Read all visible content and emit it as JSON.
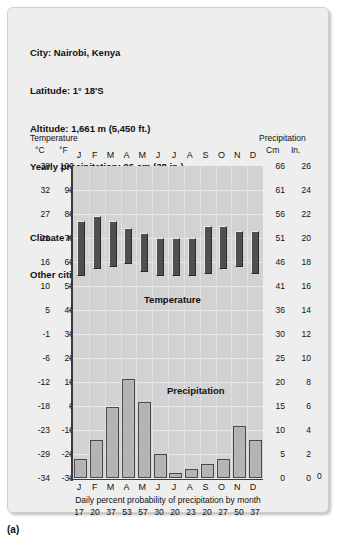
{
  "figure": {
    "label": "(a)"
  },
  "header": {
    "lines": [
      "City: Nairobi, Kenya",
      "Latitude: 1° 18'S",
      "Altitude: 1,661 m (5,450 ft.)",
      "Yearly precipitation: 96 cm (38 in.)"
    ],
    "lines2": [
      "Climate name: Savanna",
      "Other cities with similar climates: Dakar, Kampala"
    ]
  },
  "axes": {
    "left_title": "Temperature",
    "right_title": "Precipitation",
    "left_unit_primary": "°C",
    "left_unit_secondary": "°F",
    "right_unit_primary": "Cm",
    "right_unit_secondary": "In.",
    "celsius_ticks": [
      "38",
      "32",
      "27",
      "21",
      "16",
      "10",
      "5",
      "-1",
      "-6",
      "-12",
      "-18",
      "-23",
      "-29",
      "-34"
    ],
    "fahrenheit_ticks": [
      "100",
      "90",
      "80",
      "70",
      "60",
      "50",
      "40",
      "30",
      "20",
      "10",
      "0",
      "-10",
      "-20",
      "-30"
    ],
    "cm_ticks": [
      "66",
      "61",
      "56",
      "51",
      "46",
      "41",
      "36",
      "30",
      "25",
      "20",
      "15",
      "10",
      "5",
      "0"
    ],
    "in_ticks": [
      "26",
      "24",
      "22",
      "20",
      "18",
      "16",
      "14",
      "12",
      "10",
      "8",
      "6",
      "4",
      "2",
      "0"
    ],
    "right_zero": "0"
  },
  "labels": {
    "temperature": "Temperature",
    "precipitation": "Precipitation",
    "footer_caption": "Daily percent probability of precipitation by month"
  },
  "chart_data": {
    "type": "bar",
    "categories": [
      "J",
      "F",
      "M",
      "A",
      "M",
      "J",
      "J",
      "A",
      "S",
      "O",
      "N",
      "D"
    ],
    "xlabel": "",
    "grid": true,
    "legend": "inline-annotations",
    "series": [
      {
        "name": "Temperature",
        "type": "range-bar",
        "unit": "°F",
        "ylabel": "Temperature",
        "ylim_f": [
          -30,
          100
        ],
        "ylim_c": [
          -34,
          38
        ],
        "high_f": [
          77,
          79,
          77,
          74,
          72,
          70,
          70,
          70,
          75,
          75,
          73,
          73
        ],
        "low_f": [
          54,
          57,
          58,
          59,
          56,
          54,
          54,
          54,
          55,
          57,
          58,
          55
        ],
        "high_c": [
          25,
          26,
          25,
          23,
          22,
          21,
          21,
          21,
          24,
          24,
          23,
          23
        ],
        "low_c": [
          12,
          14,
          14,
          15,
          13,
          12,
          12,
          12,
          13,
          14,
          14,
          13
        ]
      },
      {
        "name": "Precipitation",
        "type": "bar",
        "unit": "cm",
        "ylabel": "Precipitation",
        "ylim_cm": [
          0,
          66
        ],
        "ylim_in": [
          0,
          26
        ],
        "values_cm": [
          4,
          8,
          15,
          21,
          16,
          5,
          1,
          2,
          3,
          4,
          11,
          8
        ],
        "values_in": [
          1.6,
          3.1,
          5.9,
          8.3,
          6.3,
          2.0,
          0.4,
          0.8,
          1.2,
          1.6,
          4.3,
          3.1
        ]
      }
    ],
    "probability_label": "Daily percent probability of precipitation by month",
    "probability_values": [
      "17",
      "20",
      "37",
      "53",
      "57",
      "30",
      "20",
      "23",
      "20",
      "27",
      "50",
      "37"
    ]
  }
}
